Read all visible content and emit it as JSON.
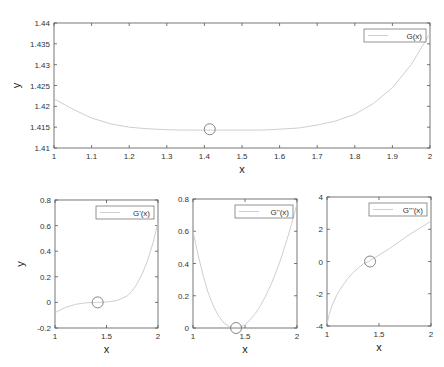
{
  "chart_data": [
    {
      "type": "line",
      "title": "",
      "xlabel": "x",
      "ylabel": "y",
      "xlim": [
        1,
        2
      ],
      "ylim": [
        1.41,
        1.44
      ],
      "xticks": [
        "1",
        "1.1",
        "1.2",
        "1.3",
        "1.4",
        "1.5",
        "1.6",
        "1.7",
        "1.8",
        "1.9",
        "2"
      ],
      "yticks": [
        "1.41",
        "1.415",
        "1.42",
        "1.425",
        "1.43",
        "1.435",
        "1.44"
      ],
      "legend": [
        "G(x)"
      ],
      "legend_position": "northeast",
      "grid": false,
      "series": [
        {
          "name": "G(x)",
          "x": [
            1,
            1.05,
            1.1,
            1.15,
            1.2,
            1.25,
            1.3,
            1.35,
            1.4,
            1.45,
            1.5,
            1.55,
            1.6,
            1.65,
            1.7,
            1.75,
            1.8,
            1.85,
            1.9,
            1.95,
            2
          ],
          "y": [
            1.4218,
            1.4193,
            1.4172,
            1.4158,
            1.415,
            1.4146,
            1.4144,
            1.4143,
            1.4143,
            1.4143,
            1.4143,
            1.4143,
            1.4145,
            1.4148,
            1.4155,
            1.4165,
            1.4181,
            1.4207,
            1.4245,
            1.43,
            1.4375
          ]
        }
      ],
      "marker": {
        "x": 1.4142,
        "y": 1.4145,
        "shape": "circle"
      }
    },
    {
      "type": "line",
      "xlabel": "x",
      "ylabel": "y",
      "xlim": [
        1,
        2
      ],
      "ylim": [
        -0.2,
        0.8
      ],
      "xticks": [
        "1",
        "1.5",
        "2"
      ],
      "yticks": [
        "-0.2",
        "0",
        "0.2",
        "0.4",
        "0.6",
        "0.8"
      ],
      "legend": [
        "G'(x)"
      ],
      "series": [
        {
          "name": "G'(x)",
          "x": [
            1,
            1.1,
            1.2,
            1.3,
            1.4,
            1.5,
            1.6,
            1.7,
            1.75,
            1.8,
            1.85,
            1.9,
            1.95,
            2
          ],
          "y": [
            -0.08,
            -0.04,
            -0.015,
            -0.003,
            0,
            0.003,
            0.015,
            0.05,
            0.09,
            0.15,
            0.23,
            0.33,
            0.46,
            0.62
          ]
        }
      ],
      "marker": {
        "x": 1.4142,
        "y": 0,
        "shape": "circle"
      }
    },
    {
      "type": "line",
      "xlabel": "x",
      "ylabel": "",
      "xlim": [
        1,
        2
      ],
      "ylim": [
        0,
        0.8
      ],
      "xticks": [
        "1",
        "1.5",
        "2"
      ],
      "yticks": [
        "0",
        "0.2",
        "0.4",
        "0.6",
        "0.8"
      ],
      "legend": [
        "G''(x)"
      ],
      "series": [
        {
          "name": "G''(x)",
          "x": [
            1,
            1.05,
            1.1,
            1.15,
            1.2,
            1.25,
            1.3,
            1.35,
            1.4,
            1.45,
            1.5,
            1.55,
            1.6,
            1.65,
            1.7,
            1.75,
            1.8,
            1.85,
            1.9,
            1.95,
            2
          ],
          "y": [
            0.6,
            0.45,
            0.32,
            0.21,
            0.13,
            0.07,
            0.03,
            0.008,
            0,
            0.005,
            0.02,
            0.05,
            0.09,
            0.14,
            0.2,
            0.27,
            0.35,
            0.44,
            0.54,
            0.65,
            0.77
          ]
        }
      ],
      "marker": {
        "x": 1.4142,
        "y": 0,
        "shape": "circle"
      }
    },
    {
      "type": "line",
      "xlabel": "x",
      "ylabel": "",
      "xlim": [
        1,
        2
      ],
      "ylim": [
        -4,
        4
      ],
      "xticks": [
        "1",
        "1.5",
        "2"
      ],
      "yticks": [
        "-4",
        "-2",
        "0",
        "2",
        "4"
      ],
      "legend": [
        "G'''(x)"
      ],
      "series": [
        {
          "name": "G'''(x)",
          "x": [
            1,
            1.02,
            1.05,
            1.1,
            1.15,
            1.2,
            1.25,
            1.3,
            1.35,
            1.4,
            1.45,
            1.5,
            1.6,
            1.7,
            1.8,
            1.9,
            2
          ],
          "y": [
            -3.9,
            -3.3,
            -2.7,
            -2.0,
            -1.5,
            -1.05,
            -0.7,
            -0.4,
            -0.15,
            0,
            0.2,
            0.4,
            0.8,
            1.25,
            1.7,
            2.1,
            2.5
          ]
        }
      ],
      "marker": {
        "x": 1.4142,
        "y": 0,
        "shape": "circle"
      }
    }
  ]
}
